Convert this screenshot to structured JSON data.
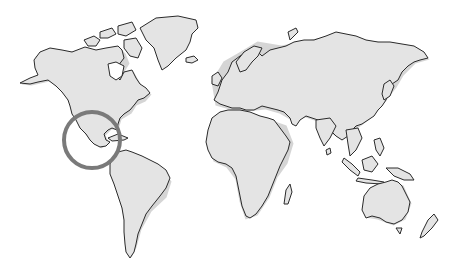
{
  "map": {
    "type": "world-outline",
    "land_color": "#e4e4e4",
    "coast_color": "#2a2a2a",
    "background": "#ffffff",
    "highlight": {
      "region": "Mexico / Central America",
      "cx": 92,
      "cy": 140,
      "r": 28,
      "stroke": "#7a7a7a",
      "stroke_width": 4
    }
  }
}
